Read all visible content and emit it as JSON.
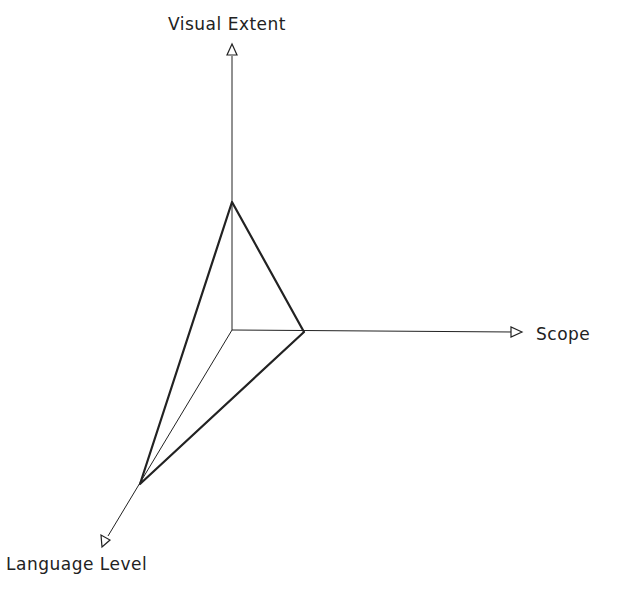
{
  "diagram": {
    "type": "3d-axes-triangle",
    "axes": [
      {
        "id": "visual-extent",
        "label": "Visual Extent",
        "direction": "up"
      },
      {
        "id": "scope",
        "label": "Scope",
        "direction": "right"
      },
      {
        "id": "language-level",
        "label": "Language Level",
        "direction": "down-left"
      }
    ],
    "colors": {
      "line": "#222222",
      "background": "#ffffff"
    }
  }
}
